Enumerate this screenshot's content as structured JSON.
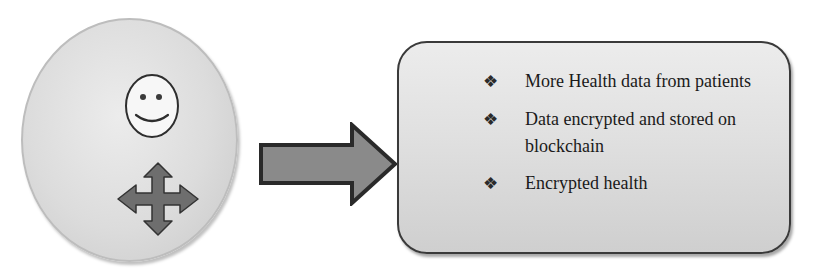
{
  "diagram": {
    "source_node": {
      "shape": "ellipse",
      "icons": [
        "smiley-face-icon",
        "four-way-move-arrows-icon"
      ]
    },
    "connector": {
      "type": "block-arrow",
      "direction": "right"
    },
    "target_node": {
      "shape": "rounded-rectangle",
      "bullet_symbol": "❖",
      "items": [
        {
          "text": "More Health data from patients"
        },
        {
          "text": "Data encrypted and stored on blockchain"
        },
        {
          "text": "Encrypted health"
        }
      ]
    },
    "colors": {
      "circle_fill": "#dcdcdc",
      "arrow_fill": "#8a8a8a",
      "arrow_stroke": "#2a2a2a",
      "box_fill": "#e0e0e0",
      "box_stroke": "#3a3a3a",
      "move_icon_fill": "#6e6e6e"
    }
  }
}
